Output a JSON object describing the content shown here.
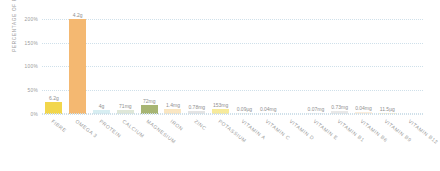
{
  "chart_data": {
    "type": "bar",
    "title": "",
    "xlabel": "",
    "ylabel": "PERCENTAGE OF RDA",
    "ylim": [
      0,
      210
    ],
    "yticks": [
      0,
      50,
      100,
      150,
      200
    ],
    "ytick_labels": [
      "0%",
      "50%",
      "100%",
      "150%",
      "200%"
    ],
    "grid": true,
    "legend": "none",
    "categories": [
      "FIBRE",
      "OMEGA 3",
      "PROTEIN",
      "CALCIUM",
      "MAGNESIUM",
      "IRON",
      "ZINC",
      "POTASSIUM",
      "VITAMIN A",
      "VITAMIN C",
      "VITAMIN D",
      "VITAMIN E",
      "VITAMIN B1",
      "VITAMIN B6",
      "VITAMIN B9",
      "VITAMIN B12"
    ],
    "values": [
      25,
      200,
      8,
      9,
      19,
      10,
      7,
      11,
      3,
      2,
      0,
      3,
      6,
      4,
      3,
      3
    ],
    "data_labels": [
      "6.2g",
      "4.2g",
      "4g",
      "71mg",
      "72mg",
      "1.4mg",
      "0.78mg",
      "153mg",
      "0.09µg",
      "0.04mg",
      "",
      "0.07mg",
      "0.73mg",
      "0.04mg",
      "11.5µg",
      ""
    ],
    "bar_colors": [
      "#f2d64b",
      "#f4b871",
      "#d7eef2",
      "#dfe7d8",
      "#a7b573",
      "#fae6c2",
      "#e4e4e4",
      "#f7ea9b",
      "#f7f7f2",
      "#fcfcfa",
      "#ffffff",
      "#f2f2f2",
      "#e8e8e8",
      "#fbeedd",
      "#fbf4d2",
      "#ffffff"
    ],
    "gridline_color": "#cfe0ea",
    "label_color": "#9a9a9a",
    "background": "#ffffff"
  }
}
